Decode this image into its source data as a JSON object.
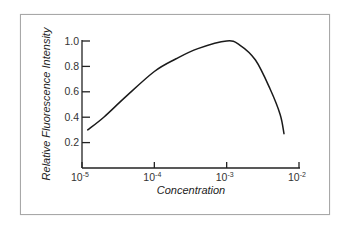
{
  "chart_data": {
    "type": "line",
    "title": "",
    "xlabel": "Concentration",
    "ylabel": "Relative Fluorescence Intensity",
    "x_scale": "log",
    "xlim": [
      1e-05,
      0.01
    ],
    "ylim": [
      0,
      1.0
    ],
    "grid": false,
    "legend": null,
    "x_ticks": [
      {
        "base": "10",
        "exp": "-5",
        "value": 1e-05
      },
      {
        "base": "10",
        "exp": "-4",
        "value": 0.0001
      },
      {
        "base": "10",
        "exp": "-3",
        "value": 0.001
      },
      {
        "base": "10",
        "exp": "-2",
        "value": 0.01
      }
    ],
    "y_ticks": [
      "0.2",
      "0.4",
      "0.6",
      "0.8",
      "1.0"
    ],
    "series": [
      {
        "name": "Relative Fluorescence Intensity",
        "color": "#1a1a1a",
        "x": [
          1.2e-05,
          2e-05,
          4e-05,
          0.0001,
          0.0002,
          0.0004,
          0.001,
          0.0015,
          0.0025,
          0.004,
          0.0055,
          0.0062
        ],
        "y": [
          0.3,
          0.4,
          0.56,
          0.76,
          0.86,
          0.94,
          1.0,
          0.97,
          0.85,
          0.62,
          0.42,
          0.27
        ]
      }
    ]
  }
}
